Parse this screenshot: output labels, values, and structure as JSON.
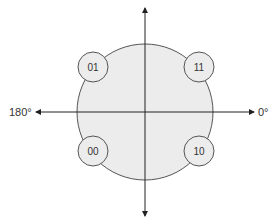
{
  "diagram": {
    "type": "constellation",
    "colors": {
      "fill": "#ececec",
      "stroke": "#555555",
      "axis": "#222222",
      "text": "#333333"
    },
    "axes": {
      "right_label": "0°",
      "left_label": "180°"
    },
    "points": [
      {
        "label": "01",
        "quadrant": "upper-left"
      },
      {
        "label": "11",
        "quadrant": "upper-right"
      },
      {
        "label": "00",
        "quadrant": "lower-left"
      },
      {
        "label": "10",
        "quadrant": "lower-right"
      }
    ]
  }
}
